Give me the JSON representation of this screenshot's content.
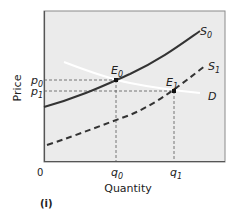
{
  "diagram": {
    "panel_label": "(i)",
    "x_axis_label": "Quantity",
    "y_axis_label": "Price",
    "origin_label": "0",
    "x_ticks": [
      {
        "base": "q",
        "sub": "0"
      },
      {
        "base": "q",
        "sub": "1"
      }
    ],
    "y_ticks": [
      {
        "base": "p",
        "sub": "0"
      },
      {
        "base": "p",
        "sub": "1"
      }
    ],
    "curves": [
      {
        "id": "S0",
        "base": "S",
        "sub": "0",
        "style": "solid",
        "color": "#333333",
        "description": "original supply curve"
      },
      {
        "id": "S1",
        "base": "S",
        "sub": "1",
        "style": "dashed",
        "color": "#333333",
        "description": "shifted supply curve"
      },
      {
        "id": "D",
        "base": "D",
        "sub": "",
        "style": "solid",
        "color": "#ffffff",
        "description": "demand curve (white, gently downward sloping)"
      }
    ],
    "points": [
      {
        "id": "E0",
        "base": "E",
        "sub": "0",
        "at": [
          "q0",
          "p0"
        ]
      },
      {
        "id": "E1",
        "base": "E",
        "sub": "1",
        "at": [
          "q1",
          "p1"
        ]
      }
    ],
    "colors": {
      "plot_background": "#ebebeb",
      "frame": "#555555",
      "curve": "#333333",
      "guide_lines": "#555555"
    }
  }
}
